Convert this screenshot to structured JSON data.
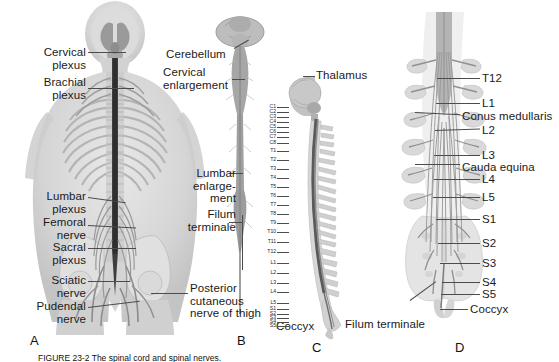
{
  "figure": {
    "width": 559,
    "height": 362,
    "background": "#ffffff",
    "caption": "FIGURE 23-2  The spinal cord and spinal nerves.",
    "ink": "#1a1a1a",
    "leader_color": "#4c4c4c",
    "tissue_gray": "#c9c9c9",
    "bone_gray": "#d8d8d8",
    "cord_gray": "#8f8f8f",
    "dark_cord": "#4a4a4a"
  },
  "panels": [
    {
      "id": "A",
      "letter": "A",
      "x": 30,
      "y": 333
    },
    {
      "id": "B",
      "letter": "B",
      "x": 237,
      "y": 333
    },
    {
      "id": "C",
      "letter": "C",
      "x": 312,
      "y": 340
    },
    {
      "id": "D",
      "letter": "D",
      "x": 455,
      "y": 340
    }
  ],
  "panel_a": {
    "name": "posterior-whole-body-nerve-plexus-view",
    "labels": [
      {
        "name": "cervical-plexus",
        "text": "Cervical\nplexus",
        "x": 24,
        "y": 46,
        "align": "right",
        "w": 62
      },
      {
        "name": "brachial-plexus",
        "text": "Brachial\nplexus",
        "x": 10,
        "y": 76,
        "align": "right",
        "w": 76
      },
      {
        "name": "lumbar-plexus",
        "text": "Lumbar\nplexus",
        "x": 17,
        "y": 190,
        "align": "right",
        "w": 69
      },
      {
        "name": "femoral-nerve",
        "text": "Femoral\nnerve",
        "x": 16,
        "y": 216,
        "align": "right",
        "w": 70
      },
      {
        "name": "sacral-plexus",
        "text": "Sacral\nplexus",
        "x": 22,
        "y": 241,
        "align": "right",
        "w": 64
      },
      {
        "name": "sciatic-nerve",
        "text": "Sciatic\nnerve",
        "x": 24,
        "y": 274,
        "align": "right",
        "w": 62
      },
      {
        "name": "pudendal-nerve",
        "text": "Pudendal\nnerve",
        "x": 6,
        "y": 300,
        "align": "right",
        "w": 80
      },
      {
        "name": "posterior-cutaneous-nerve-of-thigh",
        "text": "Posterior\ncutaneous\nnerve of thigh",
        "x": 190,
        "y": 282,
        "align": "left",
        "w": 92
      }
    ]
  },
  "panel_b": {
    "name": "isolated-spinal-cord-posterior-view",
    "labels": [
      {
        "name": "cerebellum",
        "text": "Cerebellum",
        "x": 166,
        "y": 48,
        "align": "left",
        "w": 70
      },
      {
        "name": "cervical-enlargement",
        "text": "Cervical\nenlargement",
        "x": 163,
        "y": 66,
        "align": "left",
        "w": 78
      },
      {
        "name": "lumbar-enlargement",
        "text": "Lumbar\nenlarge-\nment",
        "x": 178,
        "y": 167,
        "align": "right",
        "w": 58
      },
      {
        "name": "filum-terminale",
        "text": "Filum\nterminale",
        "x": 172,
        "y": 208,
        "align": "right",
        "w": 64
      }
    ]
  },
  "panel_c": {
    "name": "lateral-vertebral-column-with-cord",
    "labels": [
      {
        "name": "thalamus",
        "text": "Thalamus",
        "x": 316,
        "y": 69,
        "align": "left",
        "w": 60
      },
      {
        "name": "coccyx",
        "text": "Coccyx",
        "x": 276,
        "y": 320,
        "align": "left",
        "w": 44
      }
    ],
    "vertebral_levels": [
      {
        "code": "C1",
        "y": 107
      },
      {
        "code": "C2",
        "y": 112
      },
      {
        "code": "C3",
        "y": 117
      },
      {
        "code": "C4",
        "y": 122
      },
      {
        "code": "C5",
        "y": 127
      },
      {
        "code": "C6",
        "y": 132
      },
      {
        "code": "C7",
        "y": 137
      },
      {
        "code": "C8",
        "y": 143
      },
      {
        "code": "T1",
        "y": 151
      },
      {
        "code": "T2",
        "y": 160
      },
      {
        "code": "T3",
        "y": 169
      },
      {
        "code": "T4",
        "y": 178
      },
      {
        "code": "T5",
        "y": 187
      },
      {
        "code": "T6",
        "y": 196
      },
      {
        "code": "T7",
        "y": 205
      },
      {
        "code": "T8",
        "y": 214
      },
      {
        "code": "T9",
        "y": 223
      },
      {
        "code": "T10",
        "y": 232
      },
      {
        "code": "T11",
        "y": 242
      },
      {
        "code": "T12",
        "y": 252
      },
      {
        "code": "L1",
        "y": 263
      },
      {
        "code": "L2",
        "y": 273
      },
      {
        "code": "L3",
        "y": 283
      },
      {
        "code": "L4",
        "y": 292
      },
      {
        "code": "L5",
        "y": 303
      },
      {
        "code": "S1",
        "y": 309
      },
      {
        "code": "S2",
        "y": 314
      },
      {
        "code": "S3",
        "y": 318
      },
      {
        "code": "S4",
        "y": 322
      },
      {
        "code": "S5",
        "y": 326
      }
    ]
  },
  "panel_d": {
    "name": "lumbosacral-cauda-equina-posterior-view",
    "labels": [
      {
        "name": "t12",
        "text": "T12",
        "x": 482,
        "y": 72,
        "align": "left",
        "w": 30
      },
      {
        "name": "l1",
        "text": "L1",
        "x": 482,
        "y": 97,
        "align": "left",
        "w": 24
      },
      {
        "name": "conus-medullaris",
        "text": "Conus medullaris",
        "x": 462,
        "y": 110,
        "align": "left",
        "w": 96
      },
      {
        "name": "l2",
        "text": "L2",
        "x": 482,
        "y": 124,
        "align": "left",
        "w": 24
      },
      {
        "name": "l3",
        "text": "L3",
        "x": 482,
        "y": 149,
        "align": "left",
        "w": 24
      },
      {
        "name": "cauda-equina",
        "text": "Cauda equina",
        "x": 462,
        "y": 161,
        "align": "left",
        "w": 80
      },
      {
        "name": "l4",
        "text": "L4",
        "x": 482,
        "y": 173,
        "align": "left",
        "w": 24
      },
      {
        "name": "l5",
        "text": "L5",
        "x": 482,
        "y": 191,
        "align": "left",
        "w": 24
      },
      {
        "name": "s1",
        "text": "S1",
        "x": 482,
        "y": 213,
        "align": "left",
        "w": 24
      },
      {
        "name": "s2",
        "text": "S2",
        "x": 482,
        "y": 237,
        "align": "left",
        "w": 24
      },
      {
        "name": "s3",
        "text": "S3",
        "x": 482,
        "y": 257,
        "align": "left",
        "w": 24
      },
      {
        "name": "s4",
        "text": "S4",
        "x": 482,
        "y": 276,
        "align": "left",
        "w": 24
      },
      {
        "name": "s5",
        "text": "S5",
        "x": 482,
        "y": 288,
        "align": "left",
        "w": 24
      },
      {
        "name": "coccyx-d",
        "text": "Coccyx",
        "x": 470,
        "y": 303,
        "align": "left",
        "w": 46
      },
      {
        "name": "filum-terminale-d",
        "text": "Filum terminale",
        "x": 345,
        "y": 318,
        "align": "left",
        "w": 90
      }
    ]
  }
}
